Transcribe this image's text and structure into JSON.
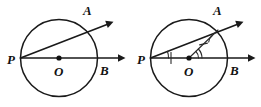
{
  "figure": {
    "background_color": "#ffffff",
    "ink_color": "#1a1a1a",
    "panels": [
      {
        "id": "left-figure",
        "name": "plain-circle-figure",
        "circle": {
          "cx": 59,
          "cy": 58,
          "r": 38.5
        },
        "center_label": "O",
        "center_dot": {
          "x": 59,
          "y": 58
        },
        "points": [
          {
            "label": "P",
            "x": 20.5,
            "y": 58,
            "label_x": 9,
            "label_y": 63
          },
          {
            "label": "A",
            "x": 88,
            "y": 30,
            "label_x": 84,
            "label_y": 14
          },
          {
            "label": "B",
            "x": 97.5,
            "y": 58,
            "label_x": 101,
            "label_y": 73
          }
        ],
        "rays": [
          {
            "name": "ray-PB",
            "from": "P",
            "through": "B",
            "x1": 20.5,
            "y1": 58,
            "x2": 122,
            "y2": 58
          },
          {
            "name": "ray-PA",
            "from": "P",
            "through": "A",
            "x1": 20.5,
            "y1": 58,
            "x2": 110,
            "y2": 23
          }
        ],
        "marks": []
      },
      {
        "id": "right-figure",
        "name": "annotated-circle-figure",
        "circle": {
          "cx": 189,
          "cy": 58,
          "r": 38.5
        },
        "center_label": "O",
        "center_dot": {
          "x": 189,
          "y": 58
        },
        "points": [
          {
            "label": "P",
            "x": 150.5,
            "y": 58,
            "label_x": 139,
            "label_y": 63
          },
          {
            "label": "A",
            "x": 218,
            "y": 30,
            "label_x": 214,
            "label_y": 14
          },
          {
            "label": "B",
            "x": 227.5,
            "y": 58,
            "label_x": 231,
            "label_y": 73
          }
        ],
        "rays": [
          {
            "name": "ray-PB",
            "from": "P",
            "through": "B",
            "x1": 150.5,
            "y1": 58,
            "x2": 252,
            "y2": 58
          },
          {
            "name": "ray-PA",
            "from": "P",
            "through": "A",
            "x1": 150.5,
            "y1": 58,
            "x2": 240,
            "y2": 23
          }
        ],
        "segments": [
          {
            "name": "segment-OA",
            "from": "O",
            "to": "A",
            "x1": 189,
            "y1": 58,
            "x2": 218,
            "y2": 30
          }
        ],
        "marks": [
          {
            "name": "tick-mark-on-PO",
            "type": "single-tick",
            "x": 171,
            "y": 58
          },
          {
            "name": "tick-mark-on-OA",
            "type": "single-tick",
            "x": 203.5,
            "y": 44
          },
          {
            "name": "angle-arc-at-P",
            "type": "single-arc",
            "vertex": "P"
          },
          {
            "name": "angle-arc-at-A",
            "type": "single-arc",
            "vertex": "A"
          },
          {
            "name": "angle-arcs-at-O",
            "type": "double-arc",
            "vertex": "O"
          }
        ]
      }
    ]
  }
}
